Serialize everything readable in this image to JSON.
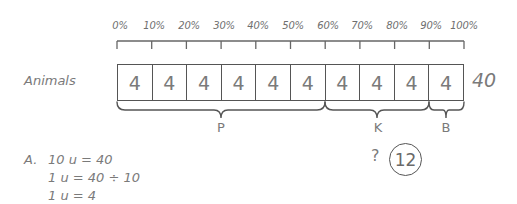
{
  "ruler": {
    "ticks": [
      "0%",
      "10%",
      "20%",
      "30%",
      "40%",
      "50%",
      "60%",
      "70%",
      "80%",
      "90%",
      "100%"
    ]
  },
  "model": {
    "row_label": "Animals",
    "units": [
      "4",
      "4",
      "4",
      "4",
      "4",
      "4",
      "4",
      "4",
      "4",
      "4"
    ],
    "total": "40"
  },
  "braces": [
    {
      "label": "P",
      "from_unit": 0,
      "to_unit": 6
    },
    {
      "label": "K",
      "from_unit": 6,
      "to_unit": 9
    },
    {
      "label": "B",
      "from_unit": 9,
      "to_unit": 10
    }
  ],
  "question": {
    "mark": "?",
    "answer": "12"
  },
  "working": {
    "prefix": "A.",
    "lines": [
      "10 u = 40",
      "1 u = 40 ÷ 10",
      "1 u = 4"
    ]
  }
}
